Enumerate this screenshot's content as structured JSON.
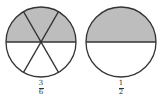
{
  "figures": [
    {
      "id": "left",
      "parts": 6,
      "shaded": 3,
      "label": {
        "numerator": "3",
        "denominator": "6"
      },
      "shade_color": "#bdbdbd"
    },
    {
      "id": "right",
      "parts": 2,
      "shaded": 1,
      "label": {
        "numerator": "1",
        "denominator": "2"
      },
      "shade_color": "#bdbdbd"
    }
  ],
  "colors": {
    "stroke": "#333333",
    "shade": "#bdbdbd",
    "background": "#ffffff"
  }
}
